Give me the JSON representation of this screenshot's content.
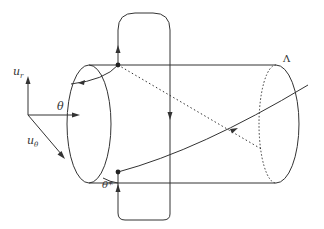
{
  "diagram": {
    "type": "cylinder-with-paths",
    "labels": {
      "u_r": "u",
      "u_r_sub": "r",
      "u_theta": "u",
      "u_theta_sub": "θ",
      "theta": "θ",
      "theta_star": "θ*",
      "lambda": "Λ"
    },
    "colors": {
      "stroke": "#333333",
      "background": "#ffffff"
    }
  }
}
